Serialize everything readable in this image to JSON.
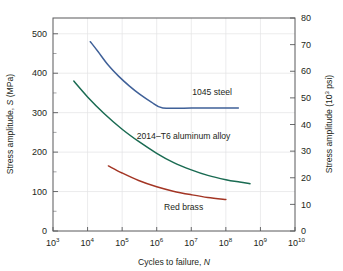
{
  "chart_data": {
    "type": "line",
    "title": "",
    "xlabel": "Cycles to failure, N",
    "ylabel": "Stress amplitude, S (MPa)",
    "ylabel_right": "Stress amplitude (10³ psi)",
    "xscale": "log",
    "xlim": [
      1000,
      10000000000
    ],
    "ylim": [
      0,
      540
    ],
    "ylim_right": [
      0,
      80
    ],
    "grid": true,
    "legend": "inline-annotations",
    "x_tick_labels": [
      "10³",
      "10⁴",
      "10⁵",
      "10⁶",
      "10⁷",
      "10⁸",
      "10⁹",
      "10¹⁰"
    ],
    "x_tick_bases": [
      "10",
      "10",
      "10",
      "10",
      "10",
      "10",
      "10",
      "10"
    ],
    "x_tick_exponents": [
      "3",
      "4",
      "5",
      "6",
      "7",
      "8",
      "9",
      "10"
    ],
    "x_tick_values": [
      1000,
      10000,
      100000,
      1000000,
      10000000,
      100000000,
      1000000000,
      10000000000
    ],
    "y_tick_labels": [
      "0",
      "100",
      "200",
      "300",
      "400",
      "500"
    ],
    "y_tick_values": [
      0,
      100,
      200,
      300,
      400,
      500
    ],
    "y_minor_values": [
      50,
      150,
      250,
      350,
      450
    ],
    "y_right_tick_labels": [
      "0",
      "10",
      "20",
      "30",
      "40",
      "50",
      "60",
      "70",
      "80"
    ],
    "y_right_tick_values": [
      0,
      10,
      20,
      30,
      40,
      50,
      60,
      70,
      80
    ],
    "series": [
      {
        "name": "1045 steel",
        "color": "#3f6098",
        "label_text": "1045 steel",
        "label_x": 40000000,
        "label_y": 345,
        "points": [
          [
            12000,
            480
          ],
          [
            20000,
            455
          ],
          [
            40000,
            420
          ],
          [
            80000,
            392
          ],
          [
            160000,
            368
          ],
          [
            320000,
            347
          ],
          [
            700000,
            327
          ],
          [
            1500000,
            312
          ],
          [
            10000000,
            312
          ],
          [
            100000000,
            312
          ],
          [
            230000000,
            312
          ]
        ]
      },
      {
        "name": "2014–T6 aluminum alloy",
        "color": "#1a6b52",
        "label_text": "2014–T6 aluminum alloy",
        "label_x": 6000000,
        "label_y": 232,
        "points": [
          [
            4000,
            380
          ],
          [
            10000,
            340
          ],
          [
            30000,
            298
          ],
          [
            100000,
            258
          ],
          [
            300000,
            227
          ],
          [
            1000000,
            197
          ],
          [
            3000000,
            174
          ],
          [
            10000000,
            155
          ],
          [
            30000000,
            141
          ],
          [
            100000000,
            130
          ],
          [
            250000000,
            124
          ],
          [
            500000000,
            120
          ]
        ]
      },
      {
        "name": "Red brass",
        "color": "#a33524",
        "label_text": "Red brass",
        "label_x": 6000000,
        "label_y": 52,
        "points": [
          [
            40000,
            165
          ],
          [
            100000,
            147
          ],
          [
            300000,
            128
          ],
          [
            1000000,
            112
          ],
          [
            3000000,
            101
          ],
          [
            10000000,
            92
          ],
          [
            30000000,
            85
          ],
          [
            100000000,
            80
          ]
        ]
      }
    ]
  },
  "figure": {
    "x_axis_label_prefix": "Cycles to failure, ",
    "x_axis_label_symbol": "N",
    "y_axis_label_prefix": "Stress amplitude, ",
    "y_axis_label_symbol": "S",
    "y_axis_label_suffix": " (MPa)",
    "y_axis_right_prefix": "Stress amplitude (10",
    "y_axis_right_sup": "3",
    "y_axis_right_suffix": " psi)"
  }
}
